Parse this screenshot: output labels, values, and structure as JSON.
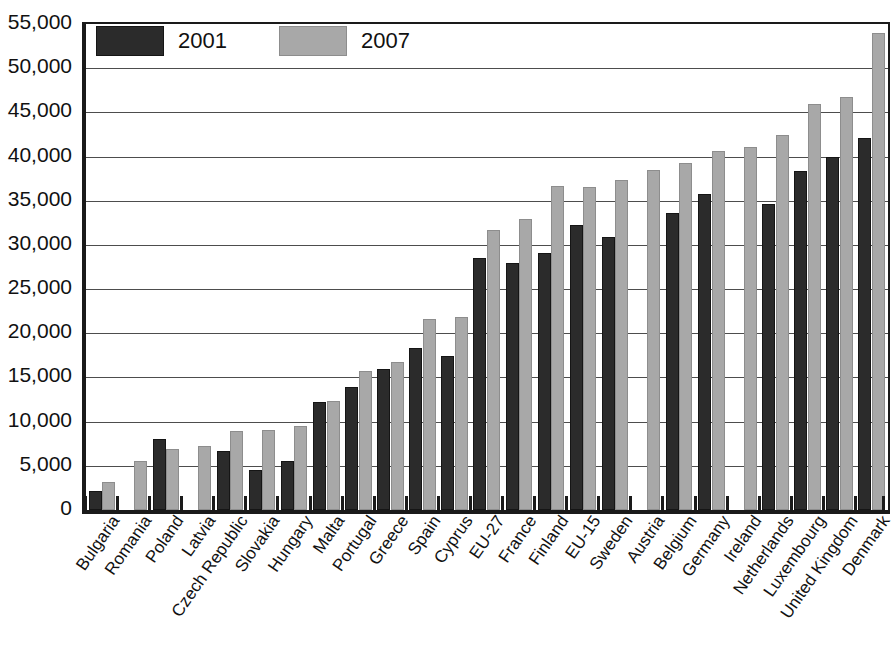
{
  "chart_data": {
    "type": "bar",
    "title": "",
    "subtitle": "",
    "xlabel": "",
    "ylabel": "",
    "ylim": [
      0,
      55000
    ],
    "ytick_step": 5000,
    "grid": true,
    "grid_axis": "y",
    "legend_position": "top-left",
    "orientation": "vertical",
    "bar_mode": "grouped",
    "ytick_labels": [
      "55,000",
      "50,000",
      "45,000",
      "40,000",
      "35,000",
      "30,000",
      "25,000",
      "20,000",
      "15,000",
      "10,000",
      "5,000",
      "0"
    ],
    "ytick_values": [
      55000,
      50000,
      45000,
      40000,
      35000,
      30000,
      25000,
      20000,
      15000,
      10000,
      5000,
      0
    ],
    "categories": [
      "Bulgaria",
      "Romania",
      "Poland",
      "Latvia",
      "Czech Republic",
      "Slovakia",
      "Hungary",
      "Malta",
      "Portugal",
      "Greece",
      "Spain",
      "Cyprus",
      "EU-27",
      "France",
      "Finland",
      "EU-15",
      "Sweden",
      "Austria",
      "Belgium",
      "Germany",
      "Ireland",
      "Netherlands",
      "Luxembourg",
      "United Kingdom",
      "Denmark"
    ],
    "series": [
      {
        "name": "2001",
        "color": "#2b2b2b",
        "values": [
          2100,
          null,
          8000,
          null,
          6700,
          4500,
          5500,
          12200,
          13900,
          16000,
          18300,
          17400,
          28500,
          27900,
          29100,
          32200,
          30900,
          null,
          33600,
          35800,
          null,
          34600,
          38400,
          39900,
          42100
        ]
      },
      {
        "name": "2007",
        "color": "#a8a8a8",
        "values": [
          3200,
          5500,
          6900,
          7200,
          8900,
          9000,
          9500,
          12300,
          15700,
          16800,
          21600,
          21800,
          31700,
          32900,
          36700,
          36600,
          37400,
          38500,
          39300,
          40600,
          41100,
          42400,
          45900,
          46700,
          54000
        ]
      }
    ],
    "legend": [
      {
        "label": "2001",
        "swatch": "dark-gray"
      },
      {
        "label": "2007",
        "swatch": "light-gray"
      }
    ],
    "colors": {
      "series_2001": "#2b2b2b",
      "series_2007": "#a8a8a8",
      "axis": "#1a1a1a",
      "gridline": "#4d4d4d",
      "background": "#ffffff"
    }
  }
}
